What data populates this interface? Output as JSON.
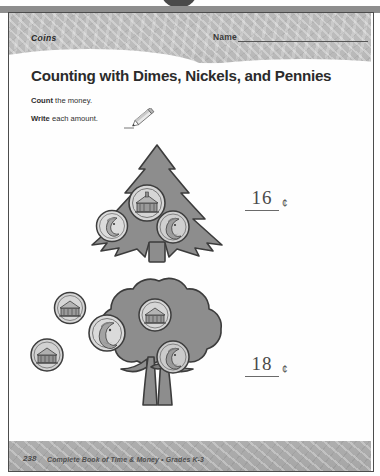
{
  "page": {
    "section_label": "Coins",
    "name_label": "Name",
    "title": "Counting with Dimes, Nickels, and Pennies",
    "instruction_1_bold": "Count",
    "instruction_1_rest": " the money.",
    "instruction_2_bold": "Write",
    "instruction_2_rest": " each amount.",
    "pencil_icon": "pencil-icon",
    "cent_symbol": "¢"
  },
  "problems": [
    {
      "id": 1,
      "tree_type": "evergreen-tree",
      "answer": "16",
      "cent_symbol": "¢",
      "coins": [
        {
          "name": "nickel",
          "face": "monticello",
          "value": 5
        },
        {
          "name": "dime",
          "face": "roosevelt",
          "value": 10
        },
        {
          "name": "penny",
          "face": "lincoln",
          "value": 1
        }
      ]
    },
    {
      "id": 2,
      "tree_type": "deciduous-tree",
      "answer": "18",
      "cent_symbol": "¢",
      "coins": [
        {
          "name": "nickel",
          "face": "monticello",
          "value": 5
        },
        {
          "name": "nickel",
          "face": "jefferson",
          "value": 5
        },
        {
          "name": "nickel",
          "face": "monticello",
          "value": 5
        },
        {
          "name": "nickel",
          "face": "monticello",
          "value": 5
        },
        {
          "name": "penny",
          "face": "lincoln",
          "value": 1
        }
      ]
    }
  ],
  "footer": {
    "page_number": "238",
    "text": "Complete Book of Time & Money  •  Grades K-3"
  },
  "colors": {
    "band_grey": "#b9b9b9",
    "tree_grey": "#8a8a8a",
    "ink": "#2b2b2b",
    "answer_ink": "#4a4a4a"
  }
}
